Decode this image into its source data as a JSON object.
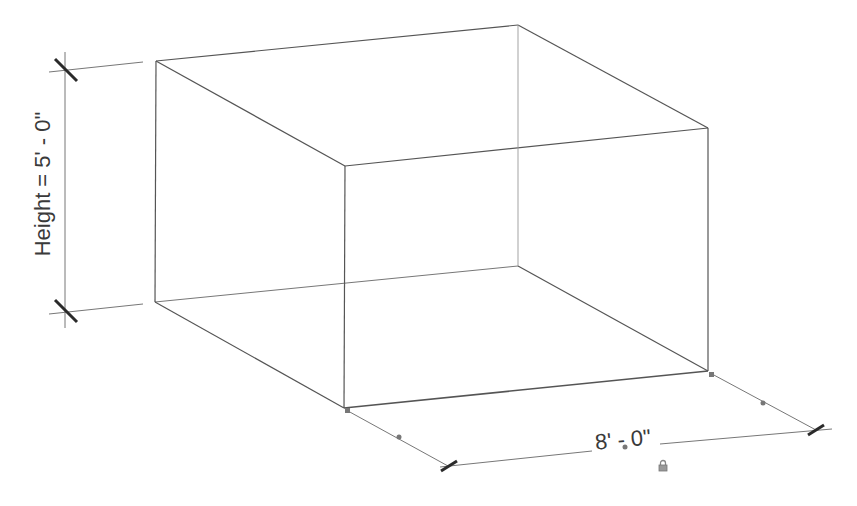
{
  "view": {
    "type": "3D isometric wireframe",
    "background": "#ffffff",
    "line_color": "#555555",
    "dim_color": "#777777",
    "tick_color": "#2a2a2a"
  },
  "box": {
    "vertices": {
      "top_back_left": [
        156,
        61
      ],
      "top_back_right": [
        518,
        25
      ],
      "top_front_left": [
        345,
        166
      ],
      "top_front_right": [
        708,
        128
      ],
      "bot_back_left": [
        155,
        302
      ],
      "bot_back_right": [
        518,
        266
      ],
      "bot_front_left": [
        344,
        408
      ],
      "bot_front_right": [
        708,
        371
      ]
    }
  },
  "dimensions": {
    "height": {
      "label": "Height = 5' - 0\"",
      "value": "5' - 0\"",
      "parameter": "Height"
    },
    "width": {
      "label": "8' - 0\""
    }
  },
  "icons": {
    "lock": "lock-icon",
    "drag_grip": "grip-dot-icon"
  }
}
